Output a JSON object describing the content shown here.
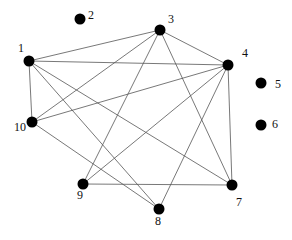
{
  "diagram": {
    "type": "undirected-graph",
    "node_color": "#000000",
    "edge_color": "#555555",
    "nodes": [
      {
        "id": "1",
        "label": "1"
      },
      {
        "id": "2",
        "label": "2"
      },
      {
        "id": "3",
        "label": "3"
      },
      {
        "id": "4",
        "label": "4"
      },
      {
        "id": "5",
        "label": "5"
      },
      {
        "id": "6",
        "label": "6"
      },
      {
        "id": "7",
        "label": "7"
      },
      {
        "id": "8",
        "label": "8"
      },
      {
        "id": "9",
        "label": "9"
      },
      {
        "id": "10",
        "label": "10"
      }
    ],
    "edges": [
      [
        "1",
        "3"
      ],
      [
        "1",
        "4"
      ],
      [
        "1",
        "10"
      ],
      [
        "1",
        "8"
      ],
      [
        "1",
        "7"
      ],
      [
        "3",
        "4"
      ],
      [
        "3",
        "10"
      ],
      [
        "3",
        "9"
      ],
      [
        "3",
        "7"
      ],
      [
        "4",
        "10"
      ],
      [
        "4",
        "9"
      ],
      [
        "4",
        "8"
      ],
      [
        "4",
        "7"
      ],
      [
        "10",
        "8"
      ],
      [
        "9",
        "7"
      ]
    ]
  }
}
